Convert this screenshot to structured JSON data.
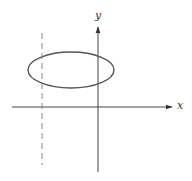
{
  "diagram": {
    "axes": {
      "x_label": "x",
      "y_label": "y",
      "origin": [
        98,
        107
      ],
      "x_axis": {
        "from": 12,
        "to": 173
      },
      "y_axis": {
        "from": 172,
        "to": 26
      }
    },
    "ellipse": {
      "cx": 71,
      "cy": 70,
      "rx": 43,
      "ry": 18
    },
    "dashed_line": {
      "x": 42,
      "y1": 33,
      "y2": 165
    },
    "colors": {
      "stroke": "#444444",
      "dashed": "#888888",
      "background": "#ffffff"
    }
  }
}
